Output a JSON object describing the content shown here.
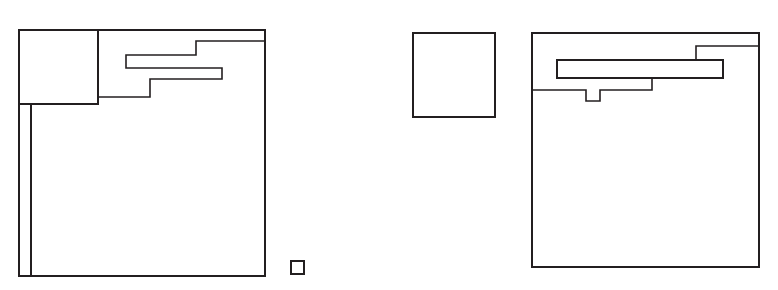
{
  "figure": {
    "background_color": "#ffffff",
    "stroke_color": "#231f20",
    "stroke_width": 1.6,
    "width": 778,
    "height": 290
  },
  "chart_data": {
    "type": "diagram",
    "title": "",
    "subtitle": "",
    "xlabel": "",
    "ylabel": "",
    "grid": false,
    "legend": null,
    "units": "pixels",
    "coordinate_system": "top-left origin, x right, y down",
    "axis_ranges": {
      "x": [
        0,
        778
      ],
      "y": [
        0,
        290
      ]
    },
    "groups": [
      {
        "name": "left-group",
        "shapes": [
          {
            "name": "left-outer-rectangle",
            "type": "rect",
            "x": 19,
            "y": 30,
            "width": 246,
            "height": 246
          },
          {
            "name": "left-inner-square",
            "type": "rect",
            "x": 19,
            "y": 30,
            "width": 79,
            "height": 74
          },
          {
            "name": "left-narrow-vertical-strip",
            "type": "rect",
            "x": 19,
            "y": 104,
            "width": 12,
            "height": 172
          },
          {
            "name": "left-stepped-comb-polygon",
            "type": "polygon",
            "closed": true,
            "points": [
              [
                98,
                30
              ],
              [
                265,
                30
              ],
              [
                265,
                41
              ],
              [
                196,
                41
              ],
              [
                196,
                55
              ],
              [
                126,
                55
              ],
              [
                126,
                68
              ],
              [
                222,
                68
              ],
              [
                222,
                79
              ],
              [
                150,
                79
              ],
              [
                150,
                97
              ],
              [
                98,
                97
              ]
            ]
          },
          {
            "name": "left-tiny-square",
            "type": "rect",
            "x": 291,
            "y": 261,
            "width": 13,
            "height": 13
          }
        ]
      },
      {
        "name": "right-group",
        "shapes": [
          {
            "name": "right-isolated-square",
            "type": "rect",
            "x": 413,
            "y": 33,
            "width": 82,
            "height": 84
          },
          {
            "name": "right-outer-rectangle",
            "type": "rect",
            "x": 532,
            "y": 33,
            "width": 227,
            "height": 234
          },
          {
            "name": "right-stepped-comb-polygon",
            "type": "polygon",
            "closed": true,
            "points": [
              [
                532,
                33
              ],
              [
                759,
                33
              ],
              [
                759,
                46
              ],
              [
                696,
                46
              ],
              [
                696,
                60
              ],
              [
                723,
                60
              ],
              [
                723,
                78
              ],
              [
                652,
                78
              ],
              [
                652,
                90
              ],
              [
                600,
                90
              ],
              [
                600,
                101
              ],
              [
                586,
                101
              ],
              [
                586,
                90
              ],
              [
                532,
                90
              ]
            ]
          },
          {
            "name": "right-middle-bar",
            "type": "rect",
            "x": 557,
            "y": 60,
            "width": 166,
            "height": 18
          }
        ]
      }
    ],
    "counts": {
      "total_shapes": 9,
      "left_group_shapes": 5,
      "right_group_shapes": 4,
      "rectangles": 7,
      "stepped_polygons": 2
    }
  }
}
